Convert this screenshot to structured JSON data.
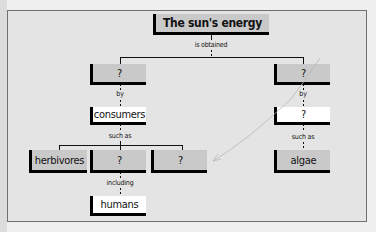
{
  "diagram": {
    "type": "concept-map",
    "root": {
      "label": "The sun's energy"
    },
    "links": {
      "obtained": "is obtained",
      "by_left": "by",
      "by_right": "by",
      "such_as_left": "such as",
      "such_as_right": "such as",
      "including": "including"
    },
    "nodes": {
      "left_level1": "?",
      "right_level1": "?",
      "consumers": "consumers",
      "right_level2": "?",
      "herbivores": "herbivores",
      "consumer_type2": "?",
      "consumer_type3": "?",
      "algae": "algae",
      "humans": "humans"
    }
  }
}
